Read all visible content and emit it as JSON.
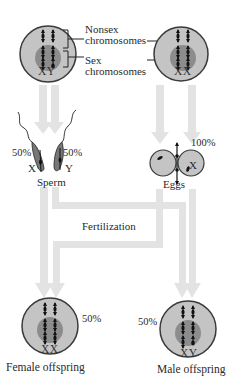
{
  "figure": {
    "parent_male": {
      "chromosome_label": "XY"
    },
    "parent_female": {
      "chromosome_label": "XX"
    },
    "labels": {
      "nonsex": "Nonsex",
      "nonsex2": "chromosomes",
      "sex": "Sex",
      "sex2": "chromosomes"
    },
    "sperm": {
      "label": "Sperm",
      "x_label": "X",
      "y_label": "Y",
      "x_pct": "50%",
      "y_pct": "50%"
    },
    "eggs": {
      "label": "Eggs",
      "x_label": "X",
      "pct": "100%"
    },
    "process": "Fertilization",
    "offspring": [
      {
        "label": "Female offspring",
        "chromosomes": "XX",
        "pct": "50%"
      },
      {
        "label": "Male offspring",
        "chromosomes": "XY",
        "pct": "50%"
      }
    ],
    "colors": {
      "cell_fill": "#c4c4c4",
      "nucleus_fill": "#8c8c8c",
      "outline": "#3a3a3a",
      "arrow": "#e3e3e3",
      "chromosome": "#111111"
    }
  }
}
